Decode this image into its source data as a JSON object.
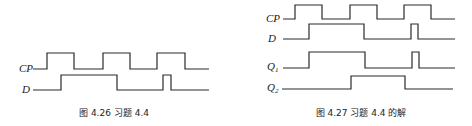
{
  "figures": [
    {
      "caption": "图 4.26   习题 4.4",
      "signals": [
        {
          "label": "CP",
          "sub": "",
          "points": "33,69 47,69 47,53 74,53 74,69 103,69 103,53 130,53 130,69 157,69 157,53 185,53 185,69 209,69",
          "lx": 19,
          "ly": 72
        },
        {
          "label": "D",
          "sub": "",
          "points": "33,90 61,90 61,75 117,75 117,90 163,90 163,75 171,75 171,90 209,90",
          "lx": 22,
          "ly": 93
        }
      ],
      "caption_x": 114,
      "caption_y": 116
    },
    {
      "caption": "图 4.27   习题 4.4 的解",
      "signals": [
        {
          "label": "CP",
          "sub": "",
          "points": "283,19 295,19 295,5 322,5 322,19 350,19 350,5 377,5 377,19 404,19 404,5 431,5 431,19 455,19",
          "lx": 266,
          "ly": 22
        },
        {
          "label": "D",
          "sub": "",
          "points": "283,39 309,39 309,24 364,24 364,39 411,39 411,24 418,24 418,39 455,39",
          "lx": 268,
          "ly": 42
        },
        {
          "label": "Q",
          "sub": "1",
          "points": "283,68 309,68 309,52 365,52 365,68 412,68 412,52 419,52 419,68 455,68",
          "lx": 267,
          "ly": 70
        },
        {
          "label": "Q",
          "sub": "2",
          "points": "282,89 351,89 351,76 405,76 405,89 453,89",
          "lx": 267,
          "ly": 91
        }
      ],
      "caption_x": 361,
      "caption_y": 116
    }
  ],
  "colors": {
    "line": "#2a2a2a",
    "background": "#ffffff"
  }
}
